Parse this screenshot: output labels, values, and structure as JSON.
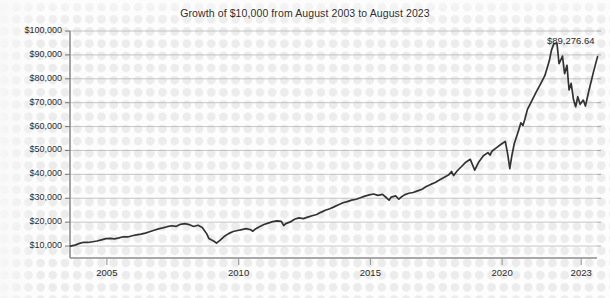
{
  "chart_data": {
    "type": "line",
    "title": "Growth of $10,000 from August 2003 to August 2023",
    "xlabel": "",
    "ylabel": "",
    "grid": "horizontal",
    "legend_position": "none",
    "xlim": [
      2003.6,
      2023.6
    ],
    "ylim": [
      5000,
      100000
    ],
    "ytick_labels": [
      "$100,000",
      "$90,000",
      "$80,000",
      "$70,000",
      "$60,000",
      "$50,000",
      "$40,000",
      "$30,000",
      "$20,000",
      "$10,000"
    ],
    "ytick_values": [
      100000,
      90000,
      80000,
      70000,
      60000,
      50000,
      40000,
      30000,
      20000,
      10000
    ],
    "xtick_labels": [
      "2005",
      "2010",
      "2015",
      "2020",
      "2023"
    ],
    "xtick_values": [
      2005,
      2010,
      2015,
      2020,
      2023
    ],
    "annotations": [
      {
        "label": "$89,276.64",
        "x": 2023.6,
        "y": 89276.64
      }
    ],
    "series": [
      {
        "name": "Growth of $10,000",
        "color": "#333333",
        "x": [
          2003.62,
          2003.79,
          2003.96,
          2004.12,
          2004.29,
          2004.46,
          2004.62,
          2004.79,
          2004.96,
          2005.12,
          2005.29,
          2005.46,
          2005.62,
          2005.79,
          2005.96,
          2006.12,
          2006.29,
          2006.46,
          2006.62,
          2006.79,
          2006.96,
          2007.12,
          2007.29,
          2007.46,
          2007.62,
          2007.79,
          2007.96,
          2008.12,
          2008.29,
          2008.46,
          2008.62,
          2008.79,
          2008.87,
          2008.96,
          2009.08,
          2009.16,
          2009.29,
          2009.46,
          2009.62,
          2009.79,
          2009.96,
          2010.12,
          2010.29,
          2010.46,
          2010.54,
          2010.62,
          2010.79,
          2010.96,
          2011.12,
          2011.29,
          2011.46,
          2011.62,
          2011.71,
          2011.79,
          2011.96,
          2012.12,
          2012.29,
          2012.46,
          2012.62,
          2012.79,
          2012.96,
          2013.12,
          2013.29,
          2013.46,
          2013.62,
          2013.79,
          2013.96,
          2014.12,
          2014.29,
          2014.46,
          2014.62,
          2014.79,
          2014.96,
          2015.12,
          2015.29,
          2015.46,
          2015.62,
          2015.71,
          2015.79,
          2015.96,
          2016.08,
          2016.16,
          2016.29,
          2016.46,
          2016.62,
          2016.79,
          2016.96,
          2017.12,
          2017.29,
          2017.46,
          2017.62,
          2017.79,
          2017.96,
          2018.08,
          2018.16,
          2018.29,
          2018.46,
          2018.62,
          2018.79,
          2018.87,
          2018.96,
          2019.12,
          2019.29,
          2019.46,
          2019.54,
          2019.62,
          2019.79,
          2019.96,
          2020.12,
          2020.21,
          2020.29,
          2020.37,
          2020.46,
          2020.62,
          2020.71,
          2020.79,
          2020.87,
          2020.96,
          2021.12,
          2021.29,
          2021.46,
          2021.62,
          2021.79,
          2021.87,
          2021.96,
          2022.08,
          2022.16,
          2022.29,
          2022.37,
          2022.46,
          2022.54,
          2022.62,
          2022.71,
          2022.79,
          2022.87,
          2022.96,
          2023.08,
          2023.16,
          2023.29,
          2023.46,
          2023.62
        ],
        "y": [
          10000,
          10400,
          11100,
          11600,
          11500,
          11800,
          12100,
          12600,
          13100,
          13200,
          13000,
          13400,
          13900,
          13800,
          14300,
          14700,
          15000,
          15400,
          16000,
          16600,
          17200,
          17600,
          18100,
          18500,
          18200,
          19100,
          19400,
          19000,
          18200,
          18700,
          17800,
          15100,
          13200,
          12600,
          11900,
          11200,
          12400,
          14100,
          15200,
          16100,
          16500,
          16900,
          17300,
          16800,
          16200,
          17000,
          18100,
          19000,
          19600,
          20200,
          20500,
          20300,
          18600,
          19400,
          20100,
          21200,
          21800,
          21500,
          22100,
          22700,
          23200,
          24100,
          25000,
          25600,
          26400,
          27300,
          28100,
          28600,
          29200,
          29600,
          30200,
          30900,
          31400,
          31800,
          31200,
          31600,
          30100,
          29200,
          30500,
          31000,
          29600,
          30400,
          31400,
          32100,
          32400,
          33100,
          33800,
          34900,
          35800,
          36600,
          37600,
          38700,
          39700,
          41200,
          39500,
          41400,
          43300,
          45100,
          46300,
          44200,
          41800,
          45300,
          47800,
          49100,
          48100,
          49800,
          51200,
          52600,
          53800,
          48600,
          42400,
          47900,
          52800,
          58300,
          61600,
          60400,
          63400,
          67200,
          70700,
          74400,
          77900,
          81300,
          87500,
          91900,
          94600,
          94900,
          86300,
          89500,
          82100,
          85600,
          75300,
          78100,
          71200,
          68300,
          72500,
          69300,
          71100,
          68600,
          74900,
          82600,
          89276.64
        ]
      }
    ]
  },
  "plot_geometry": {
    "left": 70,
    "right": 597,
    "top": 31,
    "bottom": 258
  }
}
